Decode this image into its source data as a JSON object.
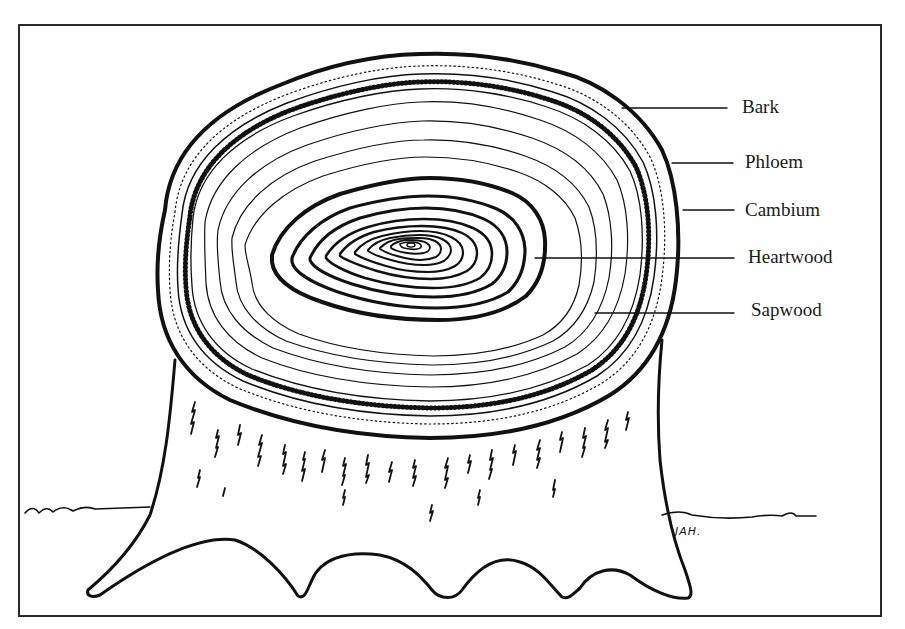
{
  "diagram": {
    "labels": [
      {
        "text": "Bark",
        "x": 742,
        "y": 97,
        "line_from": 622,
        "line_to": 727,
        "line_y": 108
      },
      {
        "text": "Phloem",
        "x": 745,
        "y": 152,
        "line_from": 672,
        "line_to": 733,
        "line_y": 163
      },
      {
        "text": "Cambium",
        "x": 745,
        "y": 200,
        "line_from": 683,
        "line_to": 734,
        "line_y": 210
      },
      {
        "text": "Heartwood",
        "x": 748,
        "y": 247,
        "line_from": 535,
        "line_to": 734,
        "line_y": 258
      },
      {
        "text": "Sapwood",
        "x": 751,
        "y": 300,
        "line_from": 595,
        "line_to": 734,
        "line_y": 313
      }
    ],
    "signature": "JAH.",
    "colors": {
      "ink": "#111111",
      "paper": "#ffffff",
      "frame": "#2a2a2a"
    }
  }
}
